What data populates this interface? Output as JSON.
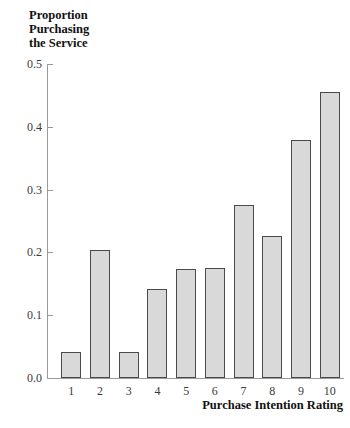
{
  "chart_data": {
    "type": "bar",
    "title": "",
    "xlabel": "Purchase Intention Rating",
    "ylabel": "Proportion Purchasing the Service",
    "ylabel_lines": [
      "Proportion",
      "Purchasing",
      "the Service"
    ],
    "categories": [
      "1",
      "2",
      "3",
      "4",
      "5",
      "6",
      "7",
      "8",
      "9",
      "10"
    ],
    "values": [
      0.042,
      0.204,
      0.042,
      0.142,
      0.174,
      0.175,
      0.275,
      0.226,
      0.379,
      0.455
    ],
    "ylim": [
      0.0,
      0.5
    ],
    "yticks": [
      "0.0",
      "0.1",
      "0.2",
      "0.3",
      "0.4",
      "0.5"
    ],
    "ytick_values": [
      0.0,
      0.1,
      0.2,
      0.3,
      0.4,
      0.5
    ],
    "grid": false,
    "legend": null,
    "bar_fill_color": "#d9d9d9",
    "bar_border_color": "#4a4a4a",
    "axis_color": "#9a9a9a",
    "text_color": "#111111"
  }
}
